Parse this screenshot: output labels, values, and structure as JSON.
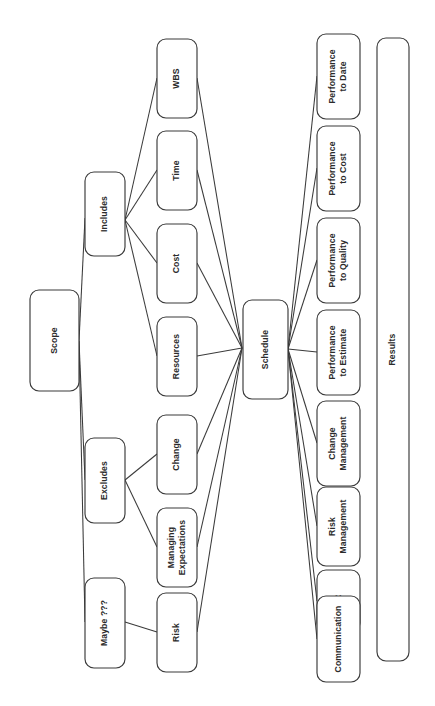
{
  "diagram": {
    "orientation": "rotated-90-ccw",
    "background_color": "#ffffff",
    "stroke_color": "#3a3a3a",
    "text_color": "#2b2b2b",
    "caption": "",
    "nodes": [
      {
        "id": "scope",
        "label": "Scope",
        "x": 30,
        "y": 290,
        "w": 49,
        "h": 101,
        "lines": [
          "Scope"
        ]
      },
      {
        "id": "includes",
        "label": "Includes",
        "x": 85,
        "y": 172,
        "w": 40,
        "h": 84,
        "lines": [
          "Includes"
        ]
      },
      {
        "id": "excludes",
        "label": "Excludes",
        "x": 85,
        "y": 438,
        "w": 40,
        "h": 85,
        "lines": [
          "Excludes"
        ]
      },
      {
        "id": "maybe",
        "label": "Maybe ???",
        "x": 85,
        "y": 578,
        "w": 40,
        "h": 90,
        "lines": [
          "Maybe ???"
        ]
      },
      {
        "id": "wbs",
        "label": "WBS",
        "x": 157,
        "y": 39,
        "w": 40,
        "h": 79,
        "lines": [
          "WBS"
        ]
      },
      {
        "id": "time",
        "label": "Time",
        "x": 157,
        "y": 131,
        "w": 40,
        "h": 79,
        "lines": [
          "Time"
        ]
      },
      {
        "id": "cost",
        "label": "Cost",
        "x": 157,
        "y": 224,
        "w": 40,
        "h": 79,
        "lines": [
          "Cost"
        ]
      },
      {
        "id": "resources",
        "label": "Resources",
        "x": 157,
        "y": 317,
        "w": 40,
        "h": 79,
        "lines": [
          "Resources"
        ]
      },
      {
        "id": "change",
        "label": "Change",
        "x": 157,
        "y": 415,
        "w": 40,
        "h": 79,
        "lines": [
          "Change"
        ]
      },
      {
        "id": "managing",
        "label": "Managing Expectations",
        "x": 157,
        "y": 508,
        "w": 40,
        "h": 79,
        "lines": [
          "Managing",
          "Expectations"
        ]
      },
      {
        "id": "risk",
        "label": "Risk",
        "x": 157,
        "y": 593,
        "w": 40,
        "h": 79,
        "lines": [
          "Risk"
        ]
      },
      {
        "id": "schedule",
        "label": "Schedule",
        "x": 243,
        "y": 300,
        "w": 45,
        "h": 99,
        "lines": [
          "Schedule"
        ]
      },
      {
        "id": "perf_date",
        "label": "Performance to Date",
        "x": 317,
        "y": 34,
        "w": 43,
        "h": 85,
        "lines": [
          "Performance",
          "to Date"
        ]
      },
      {
        "id": "perf_cost",
        "label": "Performance to Cost",
        "x": 317,
        "y": 126,
        "w": 43,
        "h": 85,
        "lines": [
          "Performance",
          "to Cost"
        ]
      },
      {
        "id": "perf_quality",
        "label": "Performance to Quality",
        "x": 317,
        "y": 218,
        "w": 43,
        "h": 85,
        "lines": [
          "Performance",
          "to Quality"
        ]
      },
      {
        "id": "perf_est",
        "label": "Performance to Estimate",
        "x": 317,
        "y": 310,
        "w": 43,
        "h": 85,
        "lines": [
          "Performance",
          "to Estimate"
        ]
      },
      {
        "id": "chg_mgmt",
        "label": "Change Management",
        "x": 317,
        "y": 401,
        "w": 43,
        "h": 85,
        "lines": [
          "Change",
          "Management"
        ]
      },
      {
        "id": "risk_mgmt",
        "label": "Risk Management",
        "x": 317,
        "y": 487,
        "w": 43,
        "h": 79,
        "lines": [
          "Risk",
          "Management"
        ]
      },
      {
        "id": "hr",
        "label": "HR",
        "x": 317,
        "y": 570,
        "w": 43,
        "h": 62,
        "lines": [
          "HR"
        ]
      },
      {
        "id": "communication",
        "label": "Communication",
        "x": 317,
        "y": 596,
        "w": 43,
        "h": 86,
        "lines": [
          "Communication"
        ]
      },
      {
        "id": "results",
        "label": "Results",
        "x": 377,
        "y": 38,
        "w": 32,
        "h": 623,
        "lines": [
          "Results"
        ]
      }
    ],
    "links": [
      {
        "from": "scope",
        "to": "includes",
        "x1": 79,
        "y1": 341,
        "x2": 85,
        "y2": 218
      },
      {
        "from": "scope",
        "to": "excludes",
        "x1": 79,
        "y1": 341,
        "x2": 85,
        "y2": 480
      },
      {
        "from": "scope",
        "to": "maybe",
        "x1": 79,
        "y1": 341,
        "x2": 85,
        "y2": 622
      },
      {
        "from": "includes",
        "to": "wbs",
        "x1": 125,
        "y1": 220,
        "x2": 157,
        "y2": 78
      },
      {
        "from": "includes",
        "to": "time",
        "x1": 125,
        "y1": 220,
        "x2": 157,
        "y2": 170
      },
      {
        "from": "includes",
        "to": "cost",
        "x1": 125,
        "y1": 220,
        "x2": 157,
        "y2": 263
      },
      {
        "from": "includes",
        "to": "resources",
        "x1": 125,
        "y1": 220,
        "x2": 157,
        "y2": 356
      },
      {
        "from": "excludes",
        "to": "change",
        "x1": 125,
        "y1": 480,
        "x2": 157,
        "y2": 454
      },
      {
        "from": "excludes",
        "to": "managing",
        "x1": 125,
        "y1": 480,
        "x2": 157,
        "y2": 547
      },
      {
        "from": "maybe",
        "to": "risk",
        "x1": 125,
        "y1": 622,
        "x2": 157,
        "y2": 632
      },
      {
        "from": "wbs",
        "to": "schedule",
        "x1": 197,
        "y1": 78,
        "x2": 242,
        "y2": 348
      },
      {
        "from": "time",
        "to": "schedule",
        "x1": 197,
        "y1": 170,
        "x2": 242,
        "y2": 348
      },
      {
        "from": "cost",
        "to": "schedule",
        "x1": 197,
        "y1": 263,
        "x2": 242,
        "y2": 348
      },
      {
        "from": "resources",
        "to": "schedule",
        "x1": 197,
        "y1": 356,
        "x2": 242,
        "y2": 348
      },
      {
        "from": "change",
        "to": "schedule",
        "x1": 197,
        "y1": 454,
        "x2": 242,
        "y2": 348
      },
      {
        "from": "managing",
        "to": "schedule",
        "x1": 197,
        "y1": 547,
        "x2": 242,
        "y2": 348
      },
      {
        "from": "risk",
        "to": "schedule",
        "x1": 197,
        "y1": 632,
        "x2": 242,
        "y2": 348
      },
      {
        "from": "schedule",
        "to": "perf_date",
        "x1": 288,
        "y1": 349,
        "x2": 317,
        "y2": 76
      },
      {
        "from": "schedule",
        "to": "perf_cost",
        "x1": 288,
        "y1": 349,
        "x2": 317,
        "y2": 168
      },
      {
        "from": "schedule",
        "to": "perf_quality",
        "x1": 288,
        "y1": 349,
        "x2": 317,
        "y2": 260
      },
      {
        "from": "schedule",
        "to": "perf_est",
        "x1": 288,
        "y1": 349,
        "x2": 317,
        "y2": 352
      },
      {
        "from": "schedule",
        "to": "chg_mgmt",
        "x1": 288,
        "y1": 349,
        "x2": 317,
        "y2": 443
      },
      {
        "from": "schedule",
        "to": "risk_mgmt",
        "x1": 288,
        "y1": 349,
        "x2": 317,
        "y2": 526
      },
      {
        "from": "schedule",
        "to": "hr",
        "x1": 288,
        "y1": 349,
        "x2": 317,
        "y2": 601
      },
      {
        "from": "schedule",
        "to": "communication",
        "x1": 288,
        "y1": 349,
        "x2": 317,
        "y2": 639
      }
    ]
  }
}
